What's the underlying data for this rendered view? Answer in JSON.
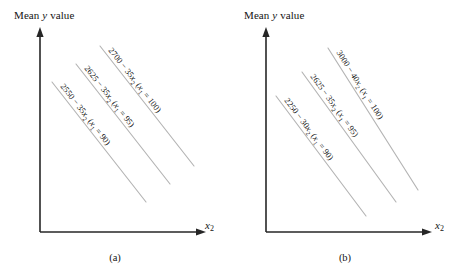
{
  "figure": {
    "panels": [
      {
        "id": "a",
        "caption": "(a)",
        "y_axis_label_prefix": "Mean ",
        "y_axis_label_var": "y",
        "y_axis_label_suffix": " value",
        "x_axis_label_var": "x",
        "x_axis_label_sub": "2",
        "lines": [
          {
            "name": "x1-100",
            "label_parts": [
              "2700 − 35",
              "x",
              "2",
              " (",
              "x",
              "1",
              " = 100)"
            ],
            "label_text": "2700 − 35x2 (x1 = 100)",
            "intercept": 2700,
            "slope": -35,
            "x1": 100
          },
          {
            "name": "x1-95",
            "label_parts": [
              "2625 − 35",
              "x",
              "2",
              " (",
              "x",
              "1",
              " = 95)"
            ],
            "label_text": "2625 − 35x2 (x1 = 95)",
            "intercept": 2625,
            "slope": -35,
            "x1": 95
          },
          {
            "name": "x1-90",
            "label_parts": [
              "2550 − 35",
              "x",
              "2",
              " (",
              "x",
              "1",
              " = 90)"
            ],
            "label_text": "2550 − 35x2 (x1 = 90)",
            "intercept": 2550,
            "slope": -35,
            "x1": 90
          }
        ]
      },
      {
        "id": "b",
        "caption": "(b)",
        "y_axis_label_prefix": "Mean ",
        "y_axis_label_var": "y",
        "y_axis_label_suffix": " value",
        "x_axis_label_var": "x",
        "x_axis_label_sub": "2",
        "lines": [
          {
            "name": "x1-100",
            "label_parts": [
              "3000 − 40",
              "x",
              "2",
              " (",
              "x",
              "1",
              " = 100)"
            ],
            "label_text": "3000 − 40x2 (x1 = 100)",
            "intercept": 3000,
            "slope": -40,
            "x1": 100
          },
          {
            "name": "x1-95",
            "label_parts": [
              "2625 − 35",
              "x",
              "2",
              " (",
              "x",
              "1",
              " = 95)"
            ],
            "label_text": "2625 − 35x2 (x1 = 95)",
            "intercept": 2625,
            "slope": -35,
            "x1": 95
          },
          {
            "name": "x1-90",
            "label_parts": [
              "2250 − 30",
              "x",
              "2",
              " (",
              "x",
              "1",
              " = 90)"
            ],
            "label_text": "2250 − 30x2 (x1 = 90)",
            "intercept": 2250,
            "slope": -30,
            "x1": 90
          }
        ]
      }
    ]
  },
  "chart_data": {
    "type": "line",
    "title": "",
    "xlabel": "x2",
    "ylabel": "Mean y value",
    "grid": false,
    "legend": "inline-labels",
    "axes_ticks": false,
    "panels": [
      {
        "panel": "(a)",
        "description": "Parallel response lines: no interaction between x1 and x2",
        "series": [
          {
            "name": "x1 = 100",
            "equation": "2700 - 35x2",
            "intercept": 2700,
            "slope": -35
          },
          {
            "name": "x1 = 95",
            "equation": "2625 - 35x2",
            "intercept": 2625,
            "slope": -35
          },
          {
            "name": "x1 = 90",
            "equation": "2550 - 35x2",
            "intercept": 2550,
            "slope": -35
          }
        ]
      },
      {
        "panel": "(b)",
        "description": "Non-parallel response lines: interaction between x1 and x2",
        "series": [
          {
            "name": "x1 = 100",
            "equation": "3000 - 40x2",
            "intercept": 3000,
            "slope": -40
          },
          {
            "name": "x1 = 95",
            "equation": "2625 - 35x2",
            "intercept": 2625,
            "slope": -35
          },
          {
            "name": "x1 = 90",
            "equation": "2250 - 30x2",
            "intercept": 2250,
            "slope": -30
          }
        ]
      }
    ]
  },
  "colors": {
    "axis": "#262626",
    "contour_line": "#b4b4b4",
    "text": "#141414",
    "background": "#ffffff"
  }
}
